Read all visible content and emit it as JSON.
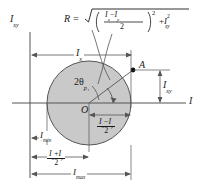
{
  "figure": {
    "type": "mohrs-circle-moments-of-inertia",
    "vertical_axis_label": "I",
    "vertical_axis_sub": "xy",
    "horizontal_axis_label": "I",
    "center_label": "O",
    "point_label": "A",
    "angle_label": "2θ",
    "angle_sub": "p₁",
    "radius_eq_lhs": "R =",
    "radius_eq_radical": "√",
    "radius_num": "I",
    "radius_num_sub1": "x",
    "radius_num_minus": "−",
    "radius_num_sub2": "y",
    "radius_den": "2",
    "radius_pow": "2",
    "radius_plus": "+",
    "radius_last": "I",
    "radius_last_sub": "xy",
    "radius_last_sup": "2",
    "dim_ix": "I",
    "dim_ix_sub": "x",
    "dim_ixy": "I",
    "dim_ixy_sub": "xy",
    "dim_imin": "I",
    "dim_imin_sub": "min",
    "dim_imax": "I",
    "dim_imax_sub": "max",
    "dim_half_diff_num_a": "I",
    "dim_half_diff_sub_a": "x",
    "dim_half_diff_op": "−",
    "dim_half_diff_num_b": "I",
    "dim_half_diff_sub_b": "y",
    "dim_half_diff_den": "2",
    "dim_half_sum_num_a": "I",
    "dim_half_sum_sub_a": "x",
    "dim_half_sum_op": "+",
    "dim_half_sum_num_b": "I",
    "dim_half_sum_sub_b": "y",
    "dim_half_sum_den": "2"
  },
  "colors": {
    "circle_fill": "#c9c9c9",
    "stroke": "#3a3a3a",
    "text": "#1a1a1a",
    "background": "#ffffff"
  },
  "geometry": {
    "circle_center_x": 89,
    "circle_center_y": 103,
    "circle_radius": 42,
    "point_a_x": 133,
    "point_a_y": 70,
    "axis_y": 103,
    "axis_x": 30
  }
}
